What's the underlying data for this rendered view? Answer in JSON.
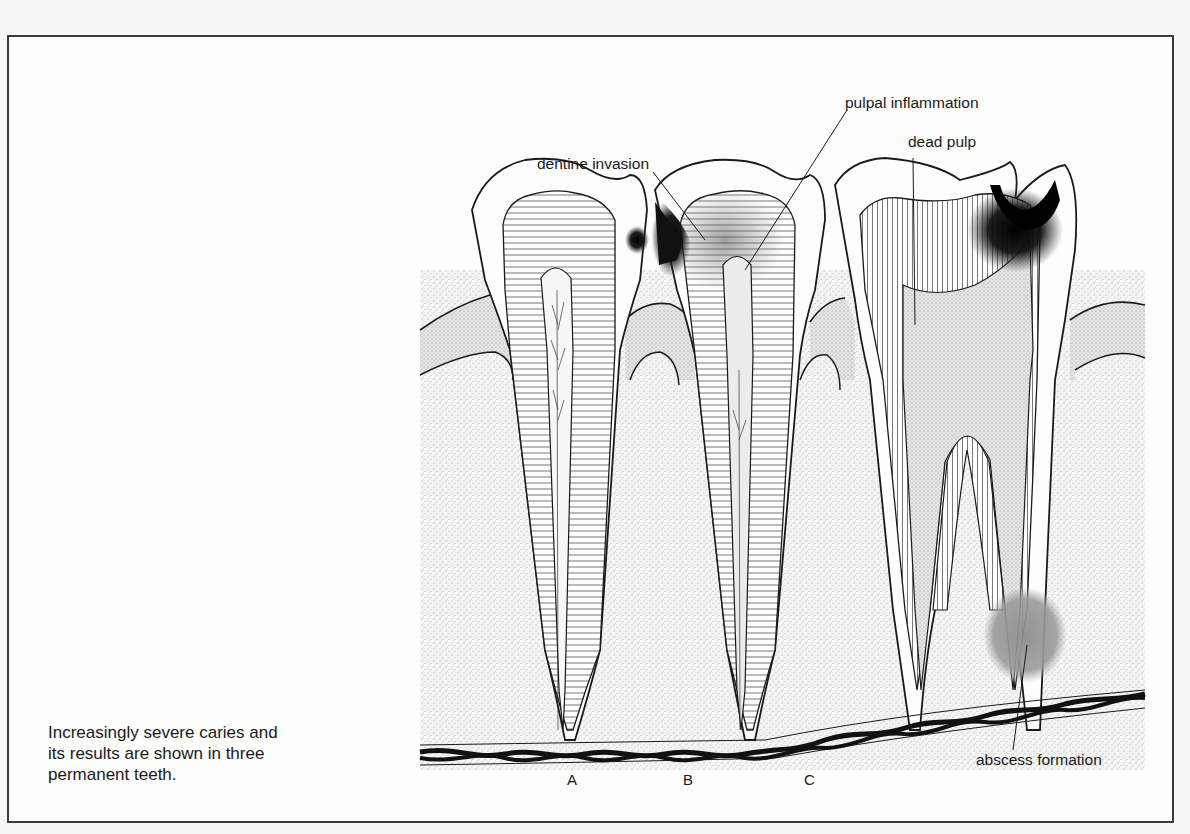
{
  "caption": {
    "lines": [
      "Increasingly severe caries and",
      "its results are shown in three",
      "permanent teeth."
    ]
  },
  "labels": {
    "dentine_invasion": "dentine invasion",
    "pulpal_inflammation": "pulpal inflammation",
    "dead_pulp": "dead pulp",
    "abscess_formation": "abscess formation"
  },
  "teeth": [
    {
      "letter": "A",
      "stage": "dentine invasion"
    },
    {
      "letter": "B",
      "stage": "pulpal inflammation"
    },
    {
      "letter": "C",
      "stage": "dead pulp with abscess formation"
    }
  ],
  "colors": {
    "frame": "#3a3a3a",
    "line": "#1a1a1a",
    "abscess": "#9a9a9a",
    "caries": "#111111",
    "bone_stipple": "#c8c8c8"
  }
}
